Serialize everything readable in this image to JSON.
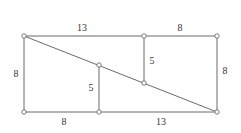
{
  "diagram": {
    "type": "geometry-rectangle-dissection",
    "colors": {
      "line": "#6a6a6a",
      "node_fill": "#ffffff",
      "text": "#333333"
    },
    "nodes": [
      {
        "id": "A",
        "x": 24,
        "y": 36
      },
      {
        "id": "B",
        "x": 144,
        "y": 36
      },
      {
        "id": "C",
        "x": 217,
        "y": 36
      },
      {
        "id": "D",
        "x": 24,
        "y": 112
      },
      {
        "id": "E",
        "x": 99,
        "y": 112
      },
      {
        "id": "F",
        "x": 217,
        "y": 112
      },
      {
        "id": "G",
        "x": 99,
        "y": 65
      },
      {
        "id": "H",
        "x": 144,
        "y": 83
      }
    ],
    "edges": [
      {
        "from": "A",
        "to": "C"
      },
      {
        "from": "A",
        "to": "D"
      },
      {
        "from": "D",
        "to": "F"
      },
      {
        "from": "C",
        "to": "F"
      },
      {
        "from": "A",
        "to": "F"
      },
      {
        "from": "B",
        "to": "H"
      },
      {
        "from": "G",
        "to": "E"
      }
    ],
    "labels": {
      "top_left": "13",
      "top_right": "8",
      "left": "8",
      "right": "8",
      "bottom_left": "8",
      "bottom_right": "13",
      "inner_upper": "5",
      "inner_lower": "5"
    }
  }
}
